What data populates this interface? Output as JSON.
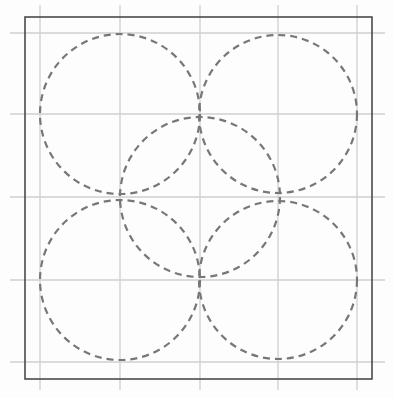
{
  "diagram": {
    "title": "",
    "width": 394,
    "height": 398,
    "colors": {
      "background": "#fdfdfd",
      "border": "#4a4a4a",
      "grid": "#cfcfcf",
      "circle_stroke": "#777777"
    },
    "border": {
      "x1": 25,
      "y1": 17,
      "x2": 372,
      "y2": 379
    },
    "grid": {
      "vertical_x": [
        40,
        120,
        200,
        278,
        357
      ],
      "horizontal_y": [
        33,
        114,
        197,
        280,
        362
      ],
      "extent": {
        "x_min": 10,
        "x_max": 385,
        "y_min": 5,
        "y_max": 390
      }
    },
    "circles": [
      {
        "name": "top-left-circle",
        "cx": 120,
        "cy": 114,
        "r": 80
      },
      {
        "name": "top-right-circle",
        "cx": 278,
        "cy": 114,
        "r": 79
      },
      {
        "name": "center-circle",
        "cx": 200,
        "cy": 197,
        "r": 80
      },
      {
        "name": "bottom-left-circle",
        "cx": 120,
        "cy": 280,
        "r": 80
      },
      {
        "name": "bottom-right-circle",
        "cx": 278,
        "cy": 280,
        "r": 79
      }
    ],
    "dash_pattern": "7 5",
    "circle_stroke_width": 2.2
  }
}
